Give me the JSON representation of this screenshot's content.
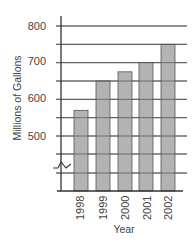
{
  "chart_data": {
    "type": "bar",
    "title": "",
    "xlabel": "Year",
    "ylabel": "Millions of Gallons",
    "categories": [
      "1998",
      "1999",
      "2000",
      "2001",
      "2002"
    ],
    "values": [
      570,
      650,
      675,
      700,
      750
    ],
    "ylim": [
      400,
      800
    ],
    "y_axis_break": true,
    "yticks": [
      500,
      600,
      700,
      800
    ],
    "ytick_labels": [
      "500",
      "600",
      "700",
      "800"
    ],
    "minor_gridlines": [
      450,
      550,
      650,
      750
    ],
    "grid": true,
    "legend": null,
    "bar_color": "#b3b3b3",
    "bar_edge_color": "#555555",
    "grid_color": "#555555"
  },
  "labels": {
    "xlabel": "Year",
    "ylabel": "Millions of Gallons",
    "yticks": [
      "800",
      "700",
      "600",
      "500"
    ],
    "categories": [
      "1998",
      "1999",
      "2000",
      "2001",
      "2002"
    ]
  }
}
